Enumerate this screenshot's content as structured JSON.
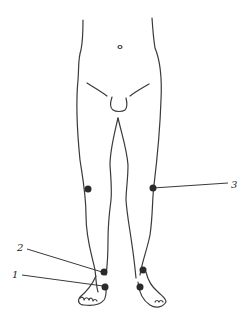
{
  "figure": {
    "points": [
      {
        "id": "knee-left",
        "label": ""
      },
      {
        "id": "knee-right",
        "label": "3"
      },
      {
        "id": "ankle-left-upper",
        "label": "2"
      },
      {
        "id": "ankle-left-lower",
        "label": "1"
      },
      {
        "id": "ankle-right-upper",
        "label": ""
      },
      {
        "id": "ankle-right-lower",
        "label": ""
      }
    ],
    "labels": {
      "one": "1",
      "two": "2",
      "three": "3"
    },
    "colors": {
      "line": "#3a3a3a",
      "dot": "#2b2b2b",
      "background": "#ffffff"
    }
  }
}
